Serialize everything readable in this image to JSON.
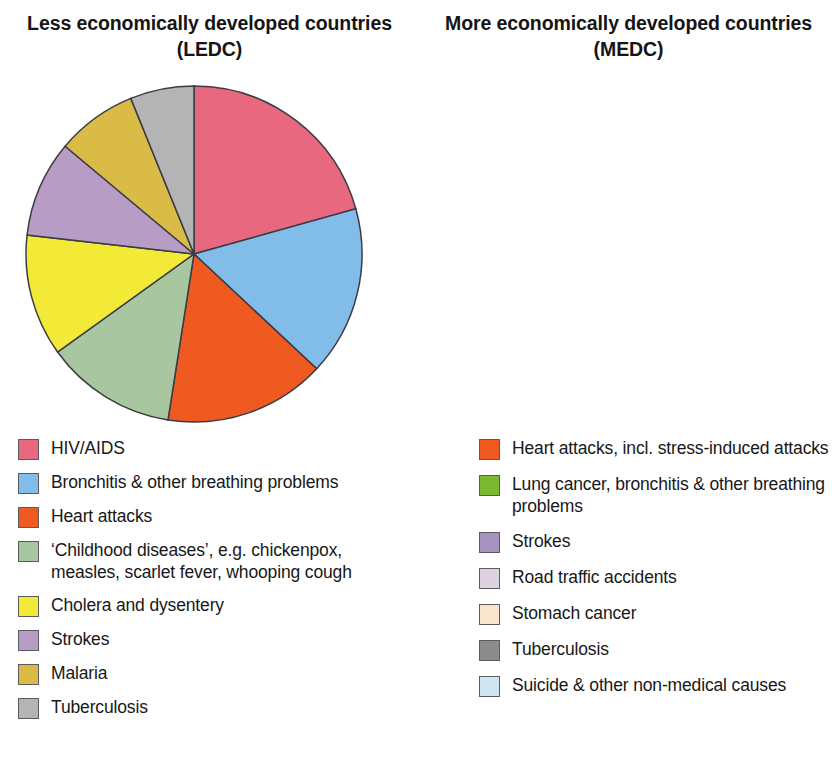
{
  "chart_data": [
    {
      "type": "pie",
      "id": "ledc",
      "title": "Less economically developed countries (LEDC)",
      "legend_position": "below",
      "categories": [
        "HIV/AIDS",
        "Bronchitis & other breathing problems",
        "Heart attacks",
        "‘Childhood diseases’, e.g. chickenpox, measles, scarlet fever, whooping cough",
        "Cholera and dysentery",
        "Strokes",
        "Malaria",
        "Tuberculosis"
      ],
      "values": [
        20.7,
        16.4,
        15.6,
        12.5,
        11.8,
        9.3,
        7.8,
        6.1
      ],
      "angles_deg": [
        74.4,
        58.7,
        55.8,
        45.4,
        42.2,
        33.4,
        28.0,
        22.1
      ],
      "colors": [
        "#e8697f",
        "#82bce8",
        "#ef5a21",
        "#a8c6a0",
        "#f2ea37",
        "#b79cc6",
        "#d9bb46",
        "#b4b4b4"
      ]
    },
    {
      "type": "pie",
      "id": "medc",
      "title": "More economically developed countries (MEDC)",
      "legend_position": "below",
      "categories": [
        "Heart attacks, incl. stress-induced attacks",
        "Lung cancer, bronchitis & other breathing problems",
        "Strokes",
        "Road traffic accidents",
        "Stomach cancer",
        "Tuberculosis",
        "Suicide & other non-medical causes"
      ],
      "values": [
        29.8,
        27.5,
        25.0,
        5.2,
        4.9,
        4.3,
        3.3
      ],
      "angles_deg": [
        107.4,
        98.6,
        90.0,
        18.8,
        17.6,
        15.5,
        12.1
      ],
      "colors": [
        "#ef5a21",
        "#7db832",
        "#a892c0",
        "#ddd2e2",
        "#fae5cd",
        "#8c8c8c",
        "#cfe5f2"
      ]
    }
  ],
  "panels": [
    {
      "title": "Less economically developed countries (LEDC)",
      "legend": [
        {
          "label": "HIV/AIDS",
          "color": "#e8697f"
        },
        {
          "label": "Bronchitis & other breathing problems",
          "color": "#82bce8"
        },
        {
          "label": "Heart attacks",
          "color": "#ef5a21"
        },
        {
          "label": "‘Childhood diseases’, e.g. chickenpox, measles, scarlet fever, whooping cough",
          "color": "#a8c6a0"
        },
        {
          "label": "Cholera and dysentery",
          "color": "#f2ea37"
        },
        {
          "label": "Strokes",
          "color": "#b79cc6"
        },
        {
          "label": "Malaria",
          "color": "#d9bb46"
        },
        {
          "label": "Tuberculosis",
          "color": "#b4b4b4"
        }
      ]
    },
    {
      "title": "More economically developed countries (MEDC)",
      "legend": [
        {
          "label": "Heart attacks, incl. stress-induced attacks",
          "color": "#ef5a21"
        },
        {
          "label": "Lung cancer, bronchitis & other breathing problems",
          "color": "#7db832"
        },
        {
          "label": "Strokes",
          "color": "#a892c0"
        },
        {
          "label": "Road traffic accidents",
          "color": "#ddd2e2"
        },
        {
          "label": "Stomach cancer",
          "color": "#fae5cd"
        },
        {
          "label": "Tuberculosis",
          "color": "#8c8c8c"
        },
        {
          "label": "Suicide & other non-medical causes",
          "color": "#cfe5f2"
        }
      ]
    }
  ]
}
